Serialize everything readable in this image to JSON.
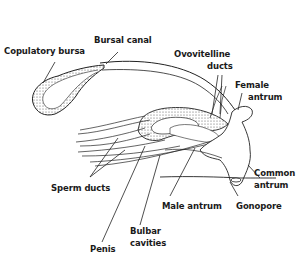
{
  "diagram": {
    "labels": [
      {
        "id": "copulatory-bursa",
        "text": "Copulatory bursa"
      },
      {
        "id": "bursal-canal",
        "text": "Bursal canal"
      },
      {
        "id": "ovovitelline-ducts-1",
        "text": "Ovovitelline"
      },
      {
        "id": "ovovitelline-ducts-2",
        "text": "ducts"
      },
      {
        "id": "female-antrum-1",
        "text": "Female"
      },
      {
        "id": "female-antrum-2",
        "text": "antrum"
      },
      {
        "id": "sperm-ducts",
        "text": "Sperm ducts"
      },
      {
        "id": "common-antrum-1",
        "text": "Common"
      },
      {
        "id": "common-antrum-2",
        "text": "antrum"
      },
      {
        "id": "male-antrum",
        "text": "Male antrum"
      },
      {
        "id": "gonopore",
        "text": "Gonopore"
      },
      {
        "id": "bulbar-cavities-1",
        "text": "Bulbar"
      },
      {
        "id": "bulbar-cavities-2",
        "text": "cavities"
      },
      {
        "id": "penis",
        "text": "Penis"
      }
    ]
  }
}
